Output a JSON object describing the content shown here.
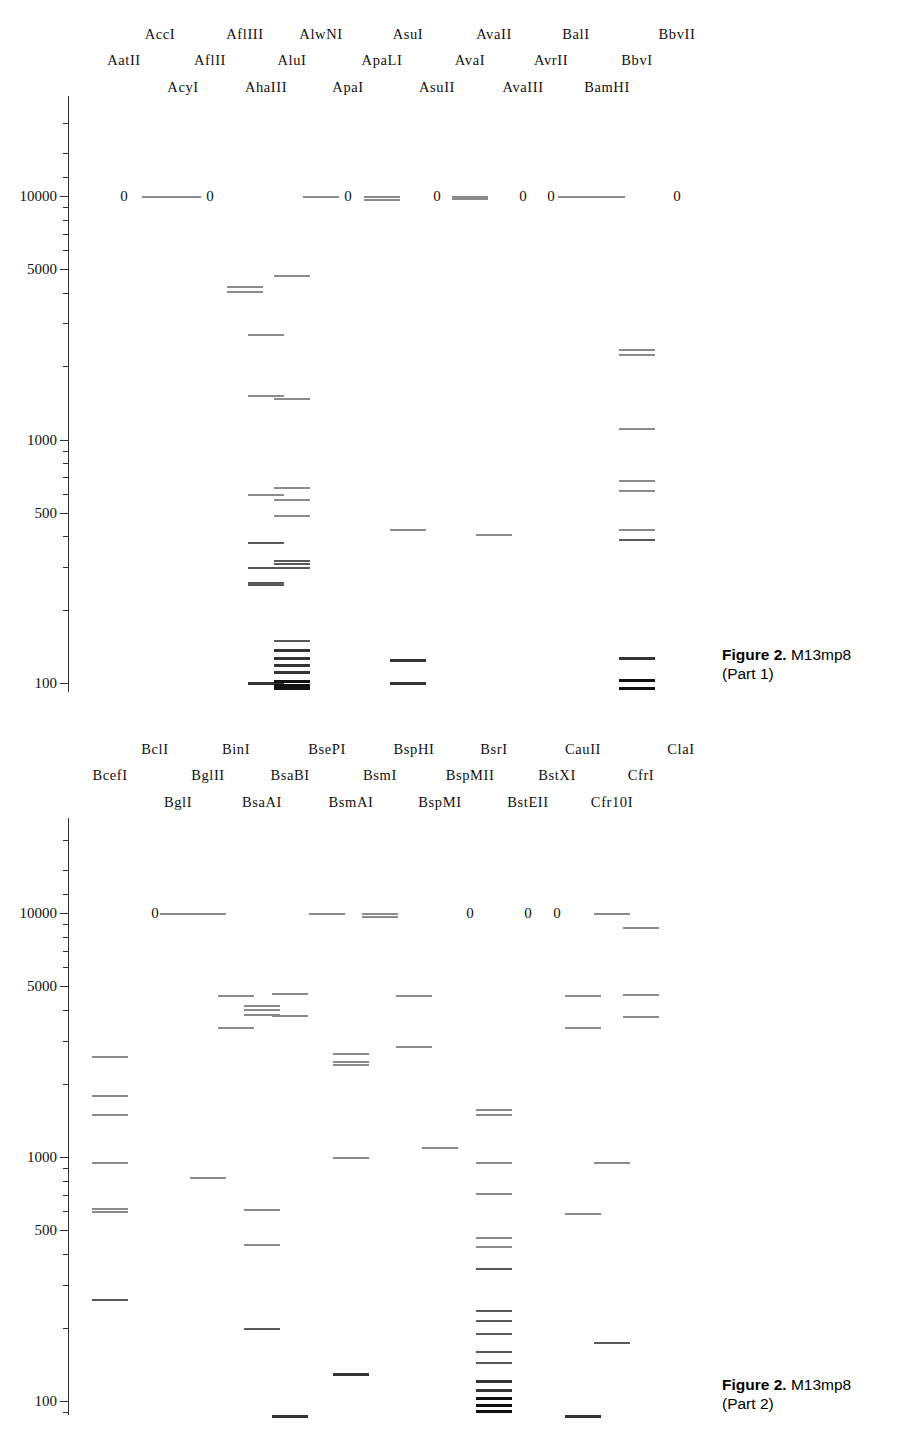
{
  "document": {
    "type": "restriction-map-figure",
    "molecule": "M13mp8"
  },
  "axis": {
    "scale": "log",
    "unit": "base pairs",
    "tick_labels": [
      "10000",
      "5000",
      "1000",
      "500",
      "100"
    ],
    "tick_values": [
      10000,
      5000,
      1000,
      500,
      100
    ],
    "range": [
      70,
      30000
    ]
  },
  "panels": [
    {
      "id": "part1",
      "caption_fig": "Figure 2.",
      "caption_title": "M13mp8",
      "caption_sub": "(Part 1)",
      "lanes": [
        {
          "name": "AatII",
          "row": 1,
          "x": 124,
          "zero": true,
          "bands": []
        },
        {
          "name": "AccI",
          "row": 0,
          "x": 160,
          "zero": false,
          "bands": [
            10000
          ]
        },
        {
          "name": "AcyI",
          "row": 2,
          "x": 183,
          "zero": false,
          "bands": [
            10000
          ]
        },
        {
          "name": "AflII",
          "row": 1,
          "x": 210,
          "zero": true,
          "bands": []
        },
        {
          "name": "AflIII",
          "row": 0,
          "x": 245,
          "zero": false,
          "bands": [
            4250,
            4080
          ]
        },
        {
          "name": "AhaIII",
          "row": 2,
          "x": 266,
          "zero": false,
          "bands": [
            2700,
            1520,
            600,
            380,
            300,
            260,
            255,
            101
          ]
        },
        {
          "name": "AluI",
          "row": 1,
          "x": 292,
          "zero": false,
          "bands": [
            4750,
            1480,
            640,
            570,
            490,
            320,
            310,
            300,
            150,
            138,
            128,
            120,
            112,
            103,
            99,
            96
          ]
        },
        {
          "name": "AlwNI",
          "row": 0,
          "x": 321,
          "zero": false,
          "bands": [
            10000
          ]
        },
        {
          "name": "ApaI",
          "row": 2,
          "x": 348,
          "zero": true,
          "bands": []
        },
        {
          "name": "ApaLI",
          "row": 1,
          "x": 382,
          "zero": false,
          "bands": [
            10000,
            9700
          ]
        },
        {
          "name": "AsuI",
          "row": 0,
          "x": 408,
          "zero": false,
          "bands": [
            430,
            126,
            101
          ]
        },
        {
          "name": "AsuII",
          "row": 2,
          "x": 437,
          "zero": true,
          "bands": []
        },
        {
          "name": "AvaI",
          "row": 1,
          "x": 470,
          "zero": false,
          "bands": [
            10000,
            9800
          ]
        },
        {
          "name": "AvaII",
          "row": 0,
          "x": 494,
          "zero": false,
          "bands": [
            410
          ]
        },
        {
          "name": "AvaIII",
          "row": 2,
          "x": 523,
          "zero": true,
          "bands": []
        },
        {
          "name": "AvrII",
          "row": 1,
          "x": 551,
          "zero": true,
          "bands": []
        },
        {
          "name": "BalI",
          "row": 0,
          "x": 576,
          "zero": false,
          "bands": [
            10000
          ]
        },
        {
          "name": "BamHI",
          "row": 2,
          "x": 607,
          "zero": false,
          "bands": [
            10000
          ]
        },
        {
          "name": "BbvI",
          "row": 1,
          "x": 637,
          "zero": false,
          "bands": [
            2350,
            2250,
            1120,
            680,
            620,
            430,
            390,
            128,
            104,
            96
          ]
        },
        {
          "name": "BbvII",
          "row": 0,
          "x": 677,
          "zero": true,
          "bands": []
        }
      ]
    },
    {
      "id": "part2",
      "caption_fig": "Figure 2.",
      "caption_title": "M13mp8",
      "caption_sub": "(Part 2)",
      "lanes": [
        {
          "name": "BcefI",
          "row": 1,
          "x": 110,
          "zero": false,
          "bands": [
            2600,
            1800,
            1500,
            950,
            620,
            600,
            262
          ]
        },
        {
          "name": "BclI",
          "row": 0,
          "x": 155,
          "zero": true,
          "bands": []
        },
        {
          "name": "BglI",
          "row": 2,
          "x": 178,
          "zero": false,
          "bands": [
            10000
          ]
        },
        {
          "name": "BglII",
          "row": 1,
          "x": 208,
          "zero": false,
          "bands": [
            10000,
            830
          ]
        },
        {
          "name": "BinI",
          "row": 0,
          "x": 236,
          "zero": false,
          "bands": [
            4600,
            3400
          ]
        },
        {
          "name": "BsaAI",
          "row": 2,
          "x": 262,
          "zero": false,
          "bands": [
            4200,
            4050,
            3850,
            610,
            440,
            200
          ]
        },
        {
          "name": "BsaBI",
          "row": 1,
          "x": 290,
          "zero": false,
          "bands": [
            4700,
            3830,
            88
          ]
        },
        {
          "name": "BsePI",
          "row": 0,
          "x": 327,
          "zero": false,
          "bands": [
            10000
          ]
        },
        {
          "name": "BsmAI",
          "row": 2,
          "x": 351,
          "zero": false,
          "bands": [
            2680,
            2480,
            2400,
            1000,
            130
          ]
        },
        {
          "name": "BsmI",
          "row": 1,
          "x": 380,
          "zero": false,
          "bands": [
            10000,
            9750
          ]
        },
        {
          "name": "BspHI",
          "row": 0,
          "x": 414,
          "zero": false,
          "bands": [
            4600,
            2850
          ]
        },
        {
          "name": "BspMI",
          "row": 2,
          "x": 440,
          "zero": false,
          "bands": [
            1100
          ]
        },
        {
          "name": "BspMII",
          "row": 1,
          "x": 470,
          "zero": true,
          "bands": []
        },
        {
          "name": "BsrI",
          "row": 0,
          "x": 494,
          "zero": false,
          "bands": [
            1580,
            1500,
            950,
            710,
            470,
            430,
            350,
            235,
            215,
            190,
            160,
            145,
            122,
            112,
            104,
            97,
            92
          ]
        },
        {
          "name": "BstEII",
          "row": 2,
          "x": 528,
          "zero": true,
          "bands": []
        },
        {
          "name": "BstXI",
          "row": 1,
          "x": 557,
          "zero": true,
          "bands": []
        },
        {
          "name": "CauII",
          "row": 0,
          "x": 583,
          "zero": false,
          "bands": [
            4600,
            3400,
            590,
            88
          ]
        },
        {
          "name": "Cfr10I",
          "row": 2,
          "x": 612,
          "zero": false,
          "bands": [
            10000,
            950,
            175
          ]
        },
        {
          "name": "CfrI",
          "row": 1,
          "x": 641,
          "zero": false,
          "bands": [
            8800,
            4650,
            3800
          ]
        },
        {
          "name": "ClaI",
          "row": 0,
          "x": 681,
          "zero": false,
          "bands": []
        }
      ]
    }
  ]
}
